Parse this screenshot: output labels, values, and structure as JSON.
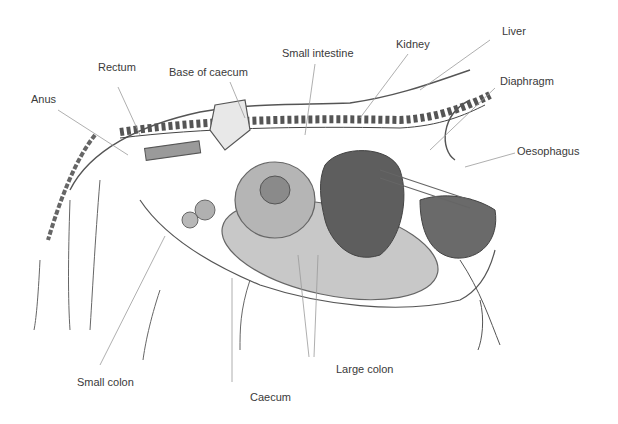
{
  "diagram": {
    "labels": [
      {
        "id": "anus",
        "text": "Anus",
        "x": 31,
        "y": 93
      },
      {
        "id": "rectum",
        "text": "Rectum",
        "x": 98,
        "y": 61
      },
      {
        "id": "base-of-caecum",
        "text": "Base of caecum",
        "x": 169,
        "y": 66
      },
      {
        "id": "small-intestine",
        "text": "Small intestine",
        "x": 282,
        "y": 47
      },
      {
        "id": "kidney",
        "text": "Kidney",
        "x": 396,
        "y": 38
      },
      {
        "id": "liver",
        "text": "Liver",
        "x": 502,
        "y": 25
      },
      {
        "id": "diaphragm",
        "text": "Diaphragm",
        "x": 500,
        "y": 75
      },
      {
        "id": "oesophagus",
        "text": "Oesophagus",
        "x": 517,
        "y": 145
      },
      {
        "id": "small-colon",
        "text": "Small colon",
        "x": 65,
        "y": 376
      },
      {
        "id": "caecum",
        "text": "Caecum",
        "x": 211,
        "y": 391
      },
      {
        "id": "large-colon",
        "text": "Large colon",
        "x": 284,
        "y": 363
      }
    ]
  }
}
